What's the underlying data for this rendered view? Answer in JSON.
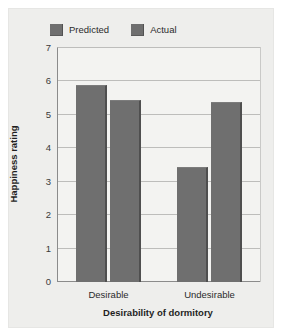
{
  "chart_data": {
    "type": "bar",
    "title": "",
    "subtitle": "",
    "xlabel": "Desirability of dormitory",
    "ylabel": "Happiness rating",
    "categories": [
      "Desirable",
      "Undesirable"
    ],
    "series": [
      {
        "name": "Predicted",
        "values": [
          5.9,
          3.45
        ],
        "color": "#6f6f6f"
      },
      {
        "name": "Actual",
        "values": [
          5.45,
          5.4
        ],
        "color": "#6f6f6f"
      }
    ],
    "ylim": [
      0,
      7
    ],
    "yticks": [
      0,
      1,
      2,
      3,
      4,
      5,
      6,
      7
    ],
    "ytick_labels": [
      "0",
      "1",
      "2",
      "3",
      "4",
      "5",
      "6",
      "7"
    ],
    "grid": "horizontal",
    "legend_position": "top-left",
    "legend": [
      "Predicted",
      "Actual"
    ]
  },
  "legend": {
    "entries": [
      {
        "label": "Predicted",
        "swatch_name": "legend-swatch-predicted"
      },
      {
        "label": "Actual",
        "swatch_name": "legend-swatch-actual"
      }
    ]
  },
  "axes": {
    "y_title": "Happiness rating",
    "x_title": "Desirability of dormitory",
    "y_ticks": [
      "7",
      "6",
      "5",
      "4",
      "3",
      "2",
      "1",
      "0"
    ],
    "x_categories": [
      "Desirable",
      "Undesirable"
    ]
  },
  "colors": {
    "bar_fill": "#6f6f6f",
    "bar_edge": "#4f4f4f",
    "plot_background": "#f3f3f1",
    "card_background": "#eeeeec",
    "gridline": "#bdbdbb",
    "axis_line": "#8b8b8b",
    "text": "#2b2b2b"
  }
}
